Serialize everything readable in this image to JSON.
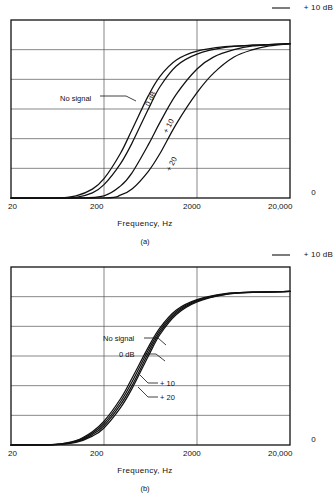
{
  "page": {
    "background": "#ffffff",
    "ink": "#111111"
  },
  "figures": [
    {
      "id": "a",
      "caption": "(a)",
      "axis": {
        "top_right_label": "+ 10 dB",
        "bottom_right_label": "0",
        "xlabel": "Frequency, Hz",
        "xticks": [
          "20",
          "200",
          "2000",
          "20,000"
        ]
      },
      "curve_labels": {
        "no_signal": "No signal",
        "zero_db": "0 dB",
        "plus_10": "+ 10",
        "plus_20": "+ 20"
      }
    },
    {
      "id": "b",
      "caption": "(b)",
      "axis": {
        "top_right_label": "+ 10 dB",
        "bottom_right_label": "0",
        "xlabel": "Frequency, Hz",
        "xticks": [
          "20",
          "200",
          "2000",
          "20,000"
        ]
      },
      "curve_labels": {
        "no_signal": "No signal",
        "zero_db": "0 dB",
        "plus_10": "+ 10",
        "plus_20": "+ 20"
      }
    }
  ],
  "chart_data": [
    {
      "type": "line",
      "id": "a",
      "title": "",
      "subtitle": "",
      "xlabel": "Frequency, Hz",
      "ylabel": "",
      "xscale": "log",
      "xlim": [
        20,
        20000
      ],
      "xticks": [
        20,
        200,
        2000,
        20000
      ],
      "xticklabels": [
        "20",
        "200",
        "2000",
        "20,000"
      ],
      "ylim": [
        0,
        12
      ],
      "ytick_annotations": {
        "top": "+ 10 dB",
        "bottom": "0"
      },
      "grid": {
        "horizontal_lines": 5,
        "vertical_lines": 2
      },
      "legend": "inline-curve-labels",
      "annotations": [
        {
          "text": "No signal",
          "curve": "No signal",
          "orientation": "horizontal-with-leader"
        },
        {
          "text": "0 dB",
          "curve": "0 dB",
          "orientation": "rotated"
        },
        {
          "text": "+ 10",
          "curve": "+ 10",
          "orientation": "rotated"
        },
        {
          "text": "+ 20",
          "curve": "+ 20",
          "orientation": "rotated"
        }
      ],
      "series": [
        {
          "name": "No signal",
          "x": [
            20,
            60,
            100,
            150,
            200,
            300,
            400,
            600,
            800,
            1200,
            2000,
            4000,
            8000,
            20000
          ],
          "values": [
            0.0,
            0.0,
            0.15,
            0.6,
            1.3,
            3.0,
            4.6,
            6.9,
            8.2,
            9.3,
            9.9,
            10.2,
            10.3,
            10.4
          ]
        },
        {
          "name": "0 dB",
          "x": [
            20,
            60,
            100,
            150,
            200,
            300,
            400,
            600,
            800,
            1200,
            2000,
            4000,
            8000,
            20000
          ],
          "values": [
            0.0,
            0.0,
            0.05,
            0.35,
            0.9,
            2.3,
            3.7,
            6.0,
            7.5,
            8.9,
            9.7,
            10.15,
            10.3,
            10.4
          ]
        },
        {
          "name": "+ 10",
          "x": [
            20,
            100,
            200,
            300,
            400,
            600,
            800,
            1200,
            2000,
            3000,
            5000,
            8000,
            20000
          ],
          "values": [
            0.0,
            0.0,
            0.15,
            0.8,
            1.7,
            3.6,
            5.1,
            7.0,
            8.7,
            9.5,
            10.0,
            10.25,
            10.4
          ]
        },
        {
          "name": "+ 20",
          "x": [
            20,
            200,
            300,
            400,
            600,
            800,
            1200,
            2000,
            3000,
            5000,
            8000,
            12000,
            20000
          ],
          "values": [
            0.0,
            0.0,
            0.2,
            0.6,
            1.8,
            3.0,
            5.0,
            7.1,
            8.4,
            9.5,
            10.0,
            10.25,
            10.4
          ]
        }
      ]
    },
    {
      "type": "line",
      "id": "b",
      "title": "",
      "subtitle": "",
      "xlabel": "Frequency, Hz",
      "ylabel": "",
      "xscale": "log",
      "xlim": [
        20,
        20000
      ],
      "xticks": [
        20,
        200,
        2000,
        20000
      ],
      "xticklabels": [
        "20",
        "200",
        "2000",
        "20,000"
      ],
      "ylim": [
        0,
        12
      ],
      "ytick_annotations": {
        "top": "+ 10 dB",
        "bottom": "0"
      },
      "grid": {
        "horizontal_lines": 5,
        "vertical_lines": 2
      },
      "legend": "inline-curve-labels",
      "annotations": [
        {
          "text": "No signal",
          "curve": "No signal",
          "orientation": "horizontal-with-leader"
        },
        {
          "text": "0 dB",
          "curve": "0 dB",
          "orientation": "horizontal-with-leader"
        },
        {
          "text": "+ 10",
          "curve": "+ 10",
          "orientation": "horizontal-with-leader"
        },
        {
          "text": "+ 20",
          "curve": "+ 20",
          "orientation": "horizontal-with-leader"
        }
      ],
      "series": [
        {
          "name": "No signal",
          "x": [
            20,
            60,
            100,
            150,
            200,
            300,
            400,
            600,
            800,
            1200,
            2000,
            4000,
            8000,
            20000
          ],
          "values": [
            0.0,
            0.05,
            0.3,
            0.9,
            1.6,
            3.1,
            4.5,
            6.6,
            7.9,
            9.1,
            9.8,
            10.2,
            10.3,
            10.35
          ]
        },
        {
          "name": "0 dB",
          "x": [
            20,
            60,
            100,
            150,
            200,
            300,
            400,
            600,
            800,
            1200,
            2000,
            4000,
            8000,
            20000
          ],
          "values": [
            0.0,
            0.04,
            0.26,
            0.8,
            1.45,
            2.9,
            4.25,
            6.4,
            7.75,
            9.0,
            9.75,
            10.18,
            10.3,
            10.35
          ]
        },
        {
          "name": "+ 10",
          "x": [
            20,
            60,
            100,
            150,
            200,
            300,
            400,
            600,
            800,
            1200,
            2000,
            4000,
            8000,
            20000
          ],
          "values": [
            0.0,
            0.03,
            0.22,
            0.7,
            1.3,
            2.7,
            4.0,
            6.2,
            7.6,
            8.9,
            9.7,
            10.16,
            10.3,
            10.35
          ]
        },
        {
          "name": "+ 20",
          "x": [
            20,
            60,
            100,
            150,
            200,
            300,
            400,
            600,
            800,
            1200,
            2000,
            4000,
            8000,
            20000
          ],
          "values": [
            0.0,
            0.02,
            0.18,
            0.6,
            1.15,
            2.5,
            3.8,
            6.0,
            7.45,
            8.8,
            9.65,
            10.14,
            10.29,
            10.35
          ]
        }
      ]
    }
  ]
}
